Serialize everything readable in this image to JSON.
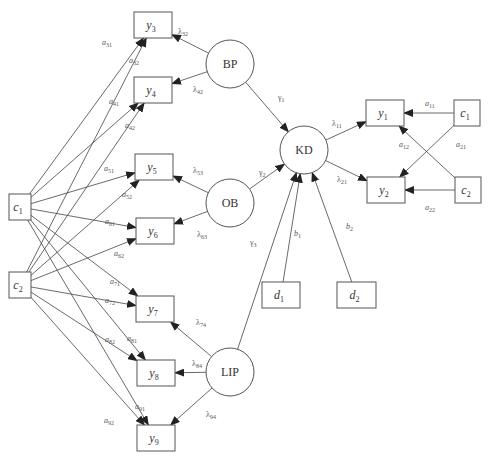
{
  "diagram": {
    "type": "structural-equation-model",
    "colors": {
      "stroke": "#555555",
      "edge": "#444444",
      "text": "#333333",
      "background": "#ffffff"
    },
    "observed_nodes": [
      {
        "id": "y3",
        "label": "y",
        "sub": "3",
        "x": 134,
        "y": 12,
        "w": 38,
        "h": 26
      },
      {
        "id": "y4",
        "label": "y",
        "sub": "4",
        "x": 134,
        "y": 77,
        "w": 38,
        "h": 26
      },
      {
        "id": "y5",
        "label": "y",
        "sub": "5",
        "x": 135,
        "y": 154,
        "w": 38,
        "h": 26
      },
      {
        "id": "y6",
        "label": "y",
        "sub": "6",
        "x": 136,
        "y": 218,
        "w": 38,
        "h": 26
      },
      {
        "id": "y7",
        "label": "y",
        "sub": "7",
        "x": 136,
        "y": 296,
        "w": 38,
        "h": 26
      },
      {
        "id": "y8",
        "label": "y",
        "sub": "8",
        "x": 137,
        "y": 360,
        "w": 38,
        "h": 26
      },
      {
        "id": "y9",
        "label": "y",
        "sub": "9",
        "x": 137,
        "y": 425,
        "w": 38,
        "h": 26
      },
      {
        "id": "y1",
        "label": "y",
        "sub": "1",
        "x": 366,
        "y": 100,
        "w": 38,
        "h": 26
      },
      {
        "id": "y2",
        "label": "y",
        "sub": "2",
        "x": 367,
        "y": 177,
        "w": 38,
        "h": 26
      },
      {
        "id": "c1L",
        "label": "c",
        "sub": "1",
        "x": 9,
        "y": 194,
        "w": 22,
        "h": 26
      },
      {
        "id": "c2L",
        "label": "c",
        "sub": "2",
        "x": 9,
        "y": 272,
        "w": 22,
        "h": 26
      },
      {
        "id": "c1R",
        "label": "c",
        "sub": "1",
        "x": 454,
        "y": 100,
        "w": 26,
        "h": 26
      },
      {
        "id": "c2R",
        "label": "c",
        "sub": "2",
        "x": 455,
        "y": 177,
        "w": 26,
        "h": 26
      },
      {
        "id": "d1",
        "label": "d",
        "sub": "1",
        "x": 262,
        "y": 282,
        "w": 38,
        "h": 26
      },
      {
        "id": "d2",
        "label": "d",
        "sub": "2",
        "x": 337,
        "y": 282,
        "w": 39,
        "h": 26
      }
    ],
    "latent_nodes": [
      {
        "id": "BP",
        "label": "BP",
        "cx": 230,
        "cy": 64,
        "r": 24
      },
      {
        "id": "OB",
        "label": "OB",
        "cx": 230,
        "cy": 203,
        "r": 24
      },
      {
        "id": "LIP",
        "label": "LIP",
        "cx": 230,
        "cy": 372,
        "r": 24
      },
      {
        "id": "KD",
        "label": "KD",
        "cx": 304,
        "cy": 150,
        "r": 24
      }
    ],
    "edges": [
      {
        "from": "BP",
        "to": "y3",
        "label": "λ32"
      },
      {
        "from": "BP",
        "to": "y4",
        "label": "λ42"
      },
      {
        "from": "OB",
        "to": "y5",
        "label": "λ53"
      },
      {
        "from": "OB",
        "to": "y6",
        "label": "λ63"
      },
      {
        "from": "LIP",
        "to": "y7",
        "label": "λ74"
      },
      {
        "from": "LIP",
        "to": "y8",
        "label": "λ84"
      },
      {
        "from": "LIP",
        "to": "y9",
        "label": "λ94"
      },
      {
        "from": "KD",
        "to": "y1",
        "label": "λ11"
      },
      {
        "from": "KD",
        "to": "y2",
        "label": "λ21"
      },
      {
        "from": "BP",
        "to": "KD",
        "label": "γ1"
      },
      {
        "from": "OB",
        "to": "KD",
        "label": "γ2"
      },
      {
        "from": "LIP",
        "to": "KD",
        "label": "γ3"
      },
      {
        "from": "d1",
        "to": "KD",
        "label": "b1"
      },
      {
        "from": "d2",
        "to": "KD",
        "label": "b2"
      },
      {
        "from": "c1R",
        "to": "y1",
        "label": "a11"
      },
      {
        "from": "c2R",
        "to": "y1",
        "label": "a12"
      },
      {
        "from": "c1R",
        "to": "y2",
        "label": "a21"
      },
      {
        "from": "c2R",
        "to": "y2",
        "label": "a22"
      },
      {
        "from": "c1L",
        "to": "y3",
        "label": "a31"
      },
      {
        "from": "c2L",
        "to": "y3",
        "label": "a32"
      },
      {
        "from": "c1L",
        "to": "y4",
        "label": "a41"
      },
      {
        "from": "c2L",
        "to": "y4",
        "label": "a42"
      },
      {
        "from": "c1L",
        "to": "y5",
        "label": "a51"
      },
      {
        "from": "c2L",
        "to": "y5",
        "label": "a52"
      },
      {
        "from": "c1L",
        "to": "y6",
        "label": "a61"
      },
      {
        "from": "c2L",
        "to": "y6",
        "label": "a62"
      },
      {
        "from": "c1L",
        "to": "y7",
        "label": "a71"
      },
      {
        "from": "c2L",
        "to": "y7",
        "label": "a72"
      },
      {
        "from": "c1L",
        "to": "y8",
        "label": "a81"
      },
      {
        "from": "c2L",
        "to": "y8",
        "label": "a82"
      },
      {
        "from": "c1L",
        "to": "y9",
        "label": "a91"
      },
      {
        "from": "c2L",
        "to": "y9",
        "label": "a92"
      }
    ],
    "edge_labels": [
      {
        "text": "λ",
        "sub": "32",
        "x": 178,
        "y": 34
      },
      {
        "text": "λ",
        "sub": "42",
        "x": 193,
        "y": 92
      },
      {
        "text": "λ",
        "sub": "53",
        "x": 193,
        "y": 173
      },
      {
        "text": "λ",
        "sub": "63",
        "x": 197,
        "y": 237
      },
      {
        "text": "λ",
        "sub": "74",
        "x": 196,
        "y": 325
      },
      {
        "text": "λ",
        "sub": "84",
        "x": 192,
        "y": 366
      },
      {
        "text": "λ",
        "sub": "94",
        "x": 206,
        "y": 417
      },
      {
        "text": "λ",
        "sub": "11",
        "x": 332,
        "y": 126
      },
      {
        "text": "λ",
        "sub": "21",
        "x": 337,
        "y": 182
      },
      {
        "text": "γ",
        "sub": "1",
        "x": 278,
        "y": 100
      },
      {
        "text": "γ",
        "sub": "2",
        "x": 259,
        "y": 175
      },
      {
        "text": "γ",
        "sub": "3",
        "x": 250,
        "y": 245
      },
      {
        "text": "b",
        "sub": "1",
        "x": 294,
        "y": 236
      },
      {
        "text": "b",
        "sub": "2",
        "x": 346,
        "y": 229
      },
      {
        "text": "a",
        "sub": "11",
        "x": 425,
        "y": 106
      },
      {
        "text": "a",
        "sub": "12",
        "x": 399,
        "y": 147
      },
      {
        "text": "a",
        "sub": "21",
        "x": 456,
        "y": 147
      },
      {
        "text": "a",
        "sub": "22",
        "x": 425,
        "y": 210
      },
      {
        "text": "a",
        "sub": "31",
        "x": 102,
        "y": 45
      },
      {
        "text": "a",
        "sub": "32",
        "x": 129,
        "y": 63
      },
      {
        "text": "a",
        "sub": "41",
        "x": 109,
        "y": 104
      },
      {
        "text": "a",
        "sub": "42",
        "x": 125,
        "y": 128
      },
      {
        "text": "a",
        "sub": "51",
        "x": 104,
        "y": 171
      },
      {
        "text": "a",
        "sub": "52",
        "x": 122,
        "y": 197
      },
      {
        "text": "a",
        "sub": "61",
        "x": 105,
        "y": 224
      },
      {
        "text": "a",
        "sub": "62",
        "x": 114,
        "y": 256
      },
      {
        "text": "a",
        "sub": "71",
        "x": 110,
        "y": 284
      },
      {
        "text": "a",
        "sub": "72",
        "x": 105,
        "y": 303
      },
      {
        "text": "a",
        "sub": "81",
        "x": 127,
        "y": 341
      },
      {
        "text": "a",
        "sub": "82",
        "x": 105,
        "y": 342
      },
      {
        "text": "a",
        "sub": "91",
        "x": 135,
        "y": 409
      },
      {
        "text": "a",
        "sub": "92",
        "x": 104,
        "y": 423
      }
    ]
  }
}
